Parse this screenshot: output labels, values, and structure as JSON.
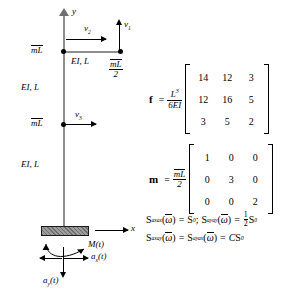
{
  "figure": {
    "type": "structural-dynamics-diagram",
    "axes": {
      "y_label": "y",
      "x_label": "x"
    },
    "frame": {
      "members": [
        {
          "id": "upper-column",
          "label": "EI, L"
        },
        {
          "id": "lower-column",
          "label": "EI, L"
        },
        {
          "id": "beam",
          "label": "EI, L"
        }
      ],
      "masses": [
        {
          "id": "beam-tip-mass",
          "label_num": "mL",
          "label_den": "2",
          "has_overbar": true
        },
        {
          "id": "joint-mass",
          "label": "mL",
          "has_overbar": true
        },
        {
          "id": "mid-column-mass",
          "label": "mL",
          "has_overbar": true
        }
      ],
      "dofs": [
        {
          "id": "v1",
          "symbol": "v",
          "index": "1",
          "direction": "up"
        },
        {
          "id": "v2",
          "symbol": "v",
          "index": "2",
          "direction": "right"
        },
        {
          "id": "v3",
          "symbol": "v",
          "index": "3",
          "direction": "right"
        }
      ],
      "support": {
        "id": "fixed-base",
        "excitations": [
          {
            "id": "moment",
            "label": "M(t)"
          },
          {
            "id": "horizontal-acceleration",
            "label": "a",
            "sub": "x",
            "suffix": "(t)"
          },
          {
            "id": "vertical-acceleration",
            "label": "a",
            "sub": "y",
            "suffix": "(t)"
          }
        ]
      }
    },
    "equations": {
      "flexibility": {
        "symbol": "f",
        "equals": "=",
        "coefficient_num": "L",
        "coefficient_num_exp": "3",
        "coefficient_den": "6EI",
        "matrix": [
          [
            "14",
            "12",
            "3"
          ],
          [
            "12",
            "16",
            "5"
          ],
          [
            "3",
            "5",
            "2"
          ]
        ]
      },
      "mass": {
        "symbol": "m",
        "equals": "=",
        "coefficient_num": "mL",
        "coefficient_den": "2",
        "matrix": [
          [
            "1",
            "0",
            "0"
          ],
          [
            "0",
            "3",
            "0"
          ],
          [
            "0",
            "0",
            "2"
          ]
        ]
      },
      "spectra": {
        "line1": {
          "term1_S": "S",
          "term1_sub": "axax",
          "term1_arg": "ω",
          "term1_eq": "=",
          "term1_val": "S",
          "term1_val_sub": "0",
          "separator": ";",
          "term2_S": "S",
          "term2_sub": "ayay",
          "term2_arg": "ω",
          "term2_eq": "=",
          "term2_frac_num": "1",
          "term2_frac_den": "2",
          "term2_val": "S",
          "term2_val_sub": "0"
        },
        "line2": {
          "term1_S": "S",
          "term1_sub": "axay",
          "term1_arg": "ω",
          "eq1": "=",
          "term2_S": "S",
          "term2_sub": "ayax",
          "term2_arg": "ω",
          "eq2": "=",
          "const": "C",
          "val": "S",
          "val_sub": "0"
        }
      }
    }
  }
}
